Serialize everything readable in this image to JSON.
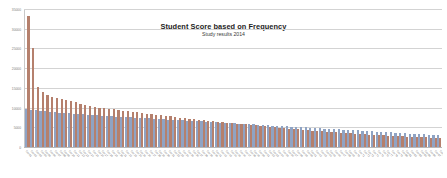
{
  "chart_data": {
    "type": "bar",
    "title": "Student Score based on Frequency",
    "subtitle": "Study results 2014",
    "xlabel": "",
    "ylabel": "",
    "grid": true,
    "legend": "none",
    "ylim": [
      0,
      35000
    ],
    "yticks": [
      0,
      5000,
      10000,
      15000,
      20000,
      25000,
      30000,
      35000
    ],
    "ytick_labels": [
      "0",
      "5000",
      "10000",
      "15000",
      "20000",
      "25000",
      "30000",
      "35000"
    ],
    "series": [
      {
        "name": "Series 1",
        "color": "#8fa3c4",
        "values": [
          9700,
          9500,
          9350,
          9200,
          9100,
          9000,
          8900,
          8800,
          8700,
          8600,
          8500,
          8400,
          8320,
          8240,
          8160,
          8080,
          8000,
          7930,
          7860,
          7790,
          7720,
          7650,
          7580,
          7510,
          7440,
          7370,
          7300,
          7230,
          7160,
          7090,
          7020,
          6950,
          6880,
          6810,
          6740,
          6670,
          6600,
          6530,
          6460,
          6390,
          6320,
          6250,
          6180,
          6110,
          6040,
          5970,
          5900,
          5830,
          5760,
          5690,
          5620,
          5550,
          5480,
          5410,
          5340,
          5270,
          5200,
          5130,
          5060,
          4990,
          4920,
          4850,
          4780,
          4710,
          4640,
          4570,
          4500,
          4430,
          4360,
          4290,
          4220,
          4150,
          4080,
          4010,
          3940,
          3870,
          3800,
          3730,
          3660,
          3590,
          3520,
          3450,
          3380,
          3310,
          3240,
          3170,
          3100,
          3030
        ]
      },
      {
        "name": "Series 2",
        "color": "#b5806d",
        "values": [
          33500,
          25400,
          15300,
          14100,
          13400,
          12900,
          12600,
          12300,
          12050,
          11800,
          11600,
          10900,
          10650,
          10400,
          10200,
          10050,
          9900,
          9750,
          9600,
          9450,
          9300,
          9150,
          9000,
          8850,
          8700,
          8550,
          8400,
          8250,
          8100,
          7950,
          7800,
          7650,
          7500,
          7350,
          7200,
          7080,
          6960,
          6840,
          6720,
          6600,
          6480,
          6360,
          6240,
          6120,
          6000,
          5880,
          5760,
          5640,
          5520,
          5400,
          5280,
          5160,
          5040,
          4920,
          4800,
          4700,
          4600,
          4500,
          4400,
          4300,
          4200,
          4100,
          4000,
          3900,
          3820,
          3740,
          3660,
          3580,
          3500,
          3420,
          3340,
          3260,
          3180,
          3100,
          3020,
          2960,
          2900,
          2840,
          2780,
          2720,
          2660,
          2600,
          2550,
          2500,
          2450,
          2400,
          2350,
          2300
        ]
      }
    ],
    "categories": [
      "Cat 01",
      "Cat 02",
      "Cat 03",
      "Cat 04",
      "Cat 05",
      "Cat 06",
      "Cat 07",
      "Cat 08",
      "Cat 09",
      "Cat 10",
      "Cat 11",
      "Cat 12",
      "Cat 13",
      "Cat 14",
      "Cat 15",
      "Cat 16",
      "Cat 17",
      "Cat 18",
      "Cat 19",
      "Cat 20",
      "Cat 21",
      "Cat 22",
      "Cat 23",
      "Cat 24",
      "Cat 25",
      "Cat 26",
      "Cat 27",
      "Cat 28",
      "Cat 29",
      "Cat 30",
      "Cat 31",
      "Cat 32",
      "Cat 33",
      "Cat 34",
      "Cat 35",
      "Cat 36",
      "Cat 37",
      "Cat 38",
      "Cat 39",
      "Cat 40",
      "Cat 41",
      "Cat 42",
      "Cat 43",
      "Cat 44",
      "Cat 45",
      "Cat 46",
      "Cat 47",
      "Cat 48",
      "Cat 49",
      "Cat 50",
      "Cat 51",
      "Cat 52",
      "Cat 53",
      "Cat 54",
      "Cat 55",
      "Cat 56",
      "Cat 57",
      "Cat 58",
      "Cat 59",
      "Cat 60",
      "Cat 61",
      "Cat 62",
      "Cat 63",
      "Cat 64",
      "Cat 65",
      "Cat 66",
      "Cat 67",
      "Cat 68",
      "Cat 69",
      "Cat 70",
      "Cat 71",
      "Cat 72",
      "Cat 73",
      "Cat 74",
      "Cat 75",
      "Cat 76",
      "Cat 77",
      "Cat 78",
      "Cat 79",
      "Cat 80",
      "Cat 81",
      "Cat 82",
      "Cat 83",
      "Cat 84",
      "Cat 85",
      "Cat 86",
      "Cat 87",
      "Cat 88"
    ]
  }
}
